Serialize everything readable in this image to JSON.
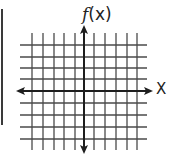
{
  "diagram": {
    "type": "coordinate-grid",
    "y_axis_label": {
      "func": "f",
      "arg": "(x)"
    },
    "x_axis_label": "X",
    "grid": {
      "vertical_lines_x": [
        32,
        43,
        54,
        64,
        75,
        94,
        105,
        116,
        127,
        137
      ],
      "horizontal_lines_y": [
        45,
        57,
        68,
        79,
        103,
        115,
        127,
        139
      ],
      "v_extent": [
        33,
        150
      ],
      "h_extent": [
        20,
        147
      ]
    },
    "axes": {
      "x_axis_y": 91,
      "x_axis_from": 16,
      "x_axis_to": 153,
      "y_axis_x": 84,
      "y_axis_from": 25,
      "y_axis_to": 154,
      "arrows": [
        "left",
        "right",
        "up",
        "down"
      ]
    },
    "colors": {
      "grid": "#4a4a4a",
      "axis": "#1e1e1e",
      "background": "#ffffff",
      "left_bar": "#3a3a3a"
    }
  }
}
